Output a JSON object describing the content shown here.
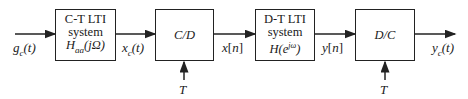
{
  "diagram": {
    "input_signal": "g_c(t)",
    "blocks": [
      {
        "line1": "C-T LTI",
        "line2": "system",
        "line3": "H_aa(jΩ)"
      },
      {
        "line1": "C/D"
      },
      {
        "line1": "D-T LTI",
        "line2": "system",
        "line3": "H(e^jω)"
      },
      {
        "line1": "D/C"
      }
    ],
    "signals": {
      "xc": "x_c(t)",
      "xn": "x[n]",
      "yn": "y[n]",
      "yc": "y_c(t)"
    },
    "sampling_period_label": "T"
  }
}
